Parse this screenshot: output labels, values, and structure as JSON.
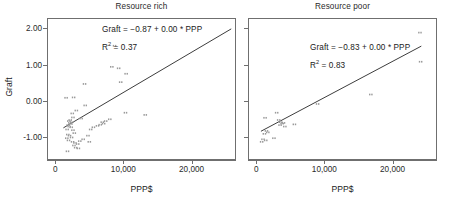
{
  "figure": {
    "right_strip_label": "Linear regression"
  },
  "chart_data": [
    {
      "type": "scatter",
      "title": "Resource rich",
      "xlabel": "PPP$",
      "ylabel": "Graft",
      "xlim": [
        -1200,
        26500
      ],
      "ylim": [
        -1.62,
        2.28
      ],
      "grid": false,
      "legend": "none",
      "xticks": [
        0,
        10000,
        20000
      ],
      "xticklabels": [
        "0",
        "10,000",
        "20,000"
      ],
      "yticks": [
        -1.0,
        0.0,
        1.0,
        2.0
      ],
      "yticklabels": [
        "-1.00",
        "0.00",
        "1.00",
        "2.00"
      ],
      "annotation_equation": "Graft = −0.87 + 0.00 * PPP",
      "annotation_r2_prefix": "R",
      "annotation_r2_exp": "2",
      "annotation_r2_value": " = 0.37",
      "r_squared": 0.37,
      "fit": {
        "intercept": -0.87,
        "slope": 0.0001105,
        "x_start": 1200,
        "x_end": 25800
      },
      "points": [
        {
          "x": 1600,
          "y": 0.09
        },
        {
          "x": 2700,
          "y": 0.1
        },
        {
          "x": 3100,
          "y": -0.26
        },
        {
          "x": 4300,
          "y": 0.47
        },
        {
          "x": 4400,
          "y": -0.12
        },
        {
          "x": 2500,
          "y": -0.34
        },
        {
          "x": 2600,
          "y": -0.45
        },
        {
          "x": 2200,
          "y": -0.52
        },
        {
          "x": 2000,
          "y": -0.55
        },
        {
          "x": 2150,
          "y": -0.6
        },
        {
          "x": 2300,
          "y": -0.63
        },
        {
          "x": 2450,
          "y": -0.58
        },
        {
          "x": 1900,
          "y": -0.66
        },
        {
          "x": 2050,
          "y": -0.7
        },
        {
          "x": 2350,
          "y": -0.72
        },
        {
          "x": 1750,
          "y": -0.78
        },
        {
          "x": 2600,
          "y": -0.8
        },
        {
          "x": 2800,
          "y": -0.88
        },
        {
          "x": 1850,
          "y": -0.92
        },
        {
          "x": 2100,
          "y": -0.95
        },
        {
          "x": 2400,
          "y": -1.0
        },
        {
          "x": 1700,
          "y": -1.02
        },
        {
          "x": 1950,
          "y": -1.08
        },
        {
          "x": 2550,
          "y": -1.12
        },
        {
          "x": 2900,
          "y": -1.15
        },
        {
          "x": 3300,
          "y": -1.18
        },
        {
          "x": 2750,
          "y": -1.22
        },
        {
          "x": 3600,
          "y": -1.1
        },
        {
          "x": 4100,
          "y": -1.05
        },
        {
          "x": 1800,
          "y": -1.38
        },
        {
          "x": 3000,
          "y": -1.28
        },
        {
          "x": 3400,
          "y": -1.3
        },
        {
          "x": 4800,
          "y": -0.95
        },
        {
          "x": 5200,
          "y": -0.78
        },
        {
          "x": 5600,
          "y": -0.72
        },
        {
          "x": 6200,
          "y": -0.68
        },
        {
          "x": 6600,
          "y": -0.65
        },
        {
          "x": 6900,
          "y": -0.58
        },
        {
          "x": 7100,
          "y": -0.62
        },
        {
          "x": 7400,
          "y": -0.55
        },
        {
          "x": 8000,
          "y": -0.5
        },
        {
          "x": 8300,
          "y": 0.94
        },
        {
          "x": 9300,
          "y": 0.9
        },
        {
          "x": 9600,
          "y": 0.52
        },
        {
          "x": 10400,
          "y": 0.75
        },
        {
          "x": 8700,
          "y": 1.52
        },
        {
          "x": 10300,
          "y": -0.32
        },
        {
          "x": 13200,
          "y": -0.38
        },
        {
          "x": 5000,
          "y": -1.12
        },
        {
          "x": 3800,
          "y": -0.48
        }
      ]
    },
    {
      "type": "scatter",
      "title": "Resource poor",
      "xlabel": "PPP$",
      "ylabel": "Graft",
      "xlim": [
        -1200,
        26500
      ],
      "ylim": [
        -1.62,
        2.28
      ],
      "grid": false,
      "legend": "none",
      "xticks": [
        0,
        10000,
        20000
      ],
      "xticklabels": [
        "0",
        "10,000",
        "20,000"
      ],
      "yticks": [
        -1.0,
        0.0,
        1.0,
        2.0
      ],
      "yticklabels": [
        "",
        "",
        "",
        ""
      ],
      "annotation_equation": "Graft = −0.83 + 0.00 * PPP",
      "annotation_r2_prefix": "R",
      "annotation_r2_exp": "2",
      "annotation_r2_value": " = 0.83",
      "r_squared": 0.83,
      "fit": {
        "intercept": -0.9,
        "slope": 9.95e-05,
        "x_start": 700,
        "x_end": 24200
      },
      "points": [
        {
          "x": 800,
          "y": -1.12
        },
        {
          "x": 1000,
          "y": -1.05
        },
        {
          "x": 1400,
          "y": -1.08
        },
        {
          "x": 1200,
          "y": -0.9
        },
        {
          "x": 1500,
          "y": -0.82
        },
        {
          "x": 1700,
          "y": -0.86
        },
        {
          "x": 2600,
          "y": -1.02
        },
        {
          "x": 1300,
          "y": -0.46
        },
        {
          "x": 3000,
          "y": -0.32
        },
        {
          "x": 3300,
          "y": -0.52
        },
        {
          "x": 3600,
          "y": -0.58
        },
        {
          "x": 3800,
          "y": -0.62
        },
        {
          "x": 4000,
          "y": -0.6
        },
        {
          "x": 4200,
          "y": -0.7
        },
        {
          "x": 3500,
          "y": -0.66
        },
        {
          "x": 5600,
          "y": -0.64
        },
        {
          "x": 9000,
          "y": -0.08
        },
        {
          "x": 16800,
          "y": 0.18
        },
        {
          "x": 24000,
          "y": 1.88
        },
        {
          "x": 24100,
          "y": 1.08
        }
      ]
    }
  ]
}
